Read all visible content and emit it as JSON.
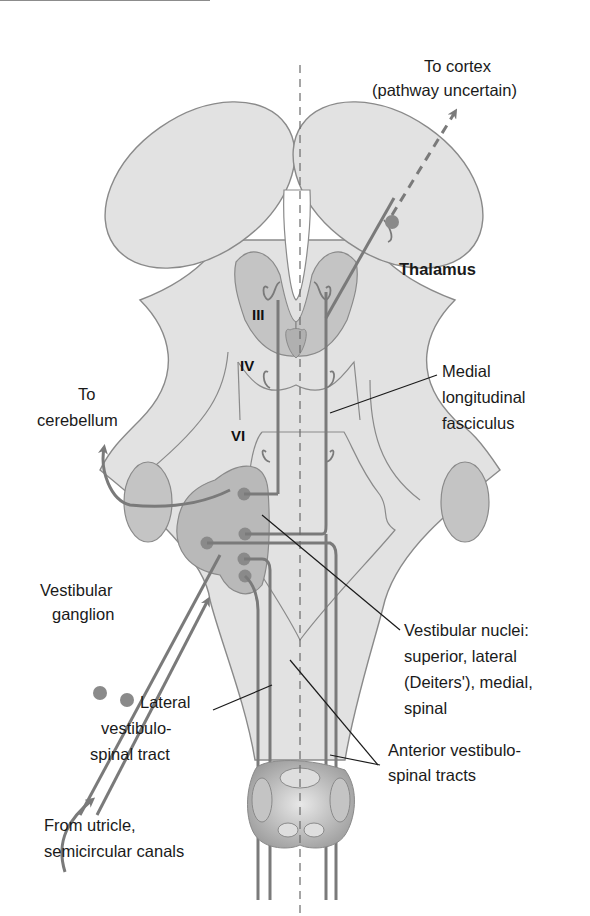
{
  "diagram": {
    "colors": {
      "tissue_fill": "#e2e2e2",
      "tissue_stroke": "#8a8a8a",
      "nucleus_fill": "#b9b9b9",
      "tract_color": "#7a7a7a",
      "leader_line": "#1a1a1a",
      "background": "#ffffff"
    },
    "labels": {
      "to_cortex": "To cortex",
      "pathway_uncertain": "(pathway uncertain)",
      "thalamus": "Thalamus",
      "nucleus_III": "III",
      "nucleus_IV": "IV",
      "nucleus_VI": "VI",
      "medial_1": "Medial",
      "medial_2": "longitudinal",
      "medial_3": "fasciculus",
      "to_1": "To",
      "to_2": "cerebellum",
      "vestibular_ganglion_1": "Vestibular",
      "vestibular_ganglion_2": "ganglion",
      "vn_1": "Vestibular nuclei:",
      "vn_2": "superior, lateral",
      "vn_3": "(Deiters'), medial,",
      "vn_4": "spinal",
      "lateral_1": "Lateral",
      "lateral_2": "vestibulo-",
      "lateral_3": "spinal tract",
      "anterior_1": "Anterior vestibulo-",
      "anterior_2": "spinal tracts",
      "from_1": "From utricle,",
      "from_2": "semicircular canals"
    }
  }
}
